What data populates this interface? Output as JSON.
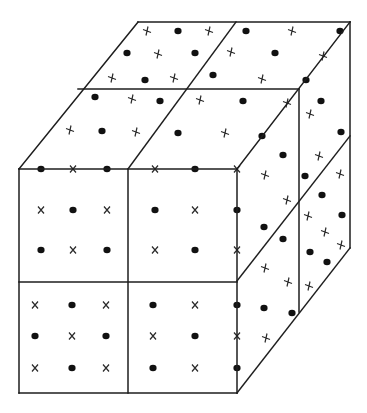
{
  "diagram": {
    "title": "",
    "colors": {
      "line": "#1e1e1e",
      "dot": "#111111",
      "cross": "#2a2a2a",
      "background": "#ffffff"
    },
    "legend": [],
    "symbol_types": [
      "dot",
      "cross"
    ],
    "faces": {
      "front": {
        "grid": "2x2",
        "rows": [
          [
            "dot",
            "cross",
            "dot",
            "cross",
            "dot",
            "cross"
          ],
          [
            "cross",
            "dot",
            "cross",
            "dot",
            "cross",
            "dot"
          ],
          [
            "dot",
            "cross",
            "dot",
            "cross",
            "dot",
            "cross"
          ],
          [
            "cross",
            "dot",
            "cross",
            "dot",
            "cross",
            "dot"
          ],
          [
            "dot",
            "cross",
            "dot",
            "cross",
            "dot",
            "cross"
          ],
          [
            "cross",
            "dot",
            "cross",
            "dot",
            "cross",
            "dot"
          ]
        ]
      },
      "top": {
        "grid": "2x2",
        "rows": [
          [
            "cross",
            "dot",
            "cross",
            "dot",
            "cross",
            "dot"
          ],
          [
            "dot",
            "cross",
            "dot",
            "cross",
            "dot",
            "cross"
          ],
          [
            "cross",
            "dot",
            "cross",
            "dot",
            "cross",
            "dot"
          ],
          [
            "dot",
            "cross",
            "dot",
            "cross",
            "dot",
            "cross"
          ],
          [
            "cross",
            "dot",
            "cross",
            "dot",
            "cross",
            "dot"
          ]
        ]
      },
      "right": {
        "grid": "2x2",
        "symbols_front_column": [
          "dot",
          "cross",
          "cross",
          "dot",
          "dot",
          "cross",
          "cross",
          "dot",
          "dot",
          "cross"
        ],
        "symbols_back_column": [
          "dot",
          "cross",
          "dot",
          "cross",
          "dot",
          "cross",
          "dot",
          "cross",
          "dot",
          "cross",
          "cross",
          "dot",
          "dot",
          "cross"
        ]
      }
    }
  }
}
